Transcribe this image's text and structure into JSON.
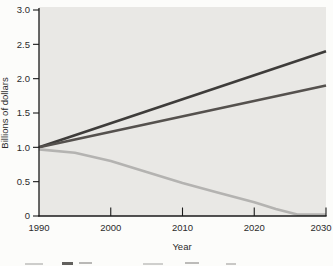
{
  "chart_data": {
    "type": "line",
    "title": "",
    "xlabel": "Year",
    "ylabel": "Billions of dollars",
    "xlim": [
      1990,
      2030
    ],
    "ylim": [
      0,
      3.0
    ],
    "xticks": [
      1990,
      2000,
      2010,
      2020,
      2030
    ],
    "yticks": [
      0,
      0.5,
      1.0,
      1.5,
      2.0,
      2.5,
      3.0
    ],
    "ytick_labels": [
      "0",
      "0.5",
      "1.0",
      "1.5",
      "2.0",
      "2.5",
      "3.0"
    ],
    "grid": false,
    "legend_position": "cropped-below-figure",
    "plot_bg": "#e9e8e5",
    "axis_color": "#1a1a1a",
    "text_color": "#2b2b2b",
    "series": [
      {
        "name": "upper-dark-line",
        "color": "#3e3c3a",
        "x": [
          1990,
          2030
        ],
        "y": [
          1.0,
          2.4
        ]
      },
      {
        "name": "lower-dark-line",
        "color": "#55514e",
        "x": [
          1990,
          2030
        ],
        "y": [
          1.0,
          1.9
        ]
      },
      {
        "name": "light-gray-declining-line",
        "color": "#b4b3b1",
        "x": [
          1990,
          1995,
          2000,
          2005,
          2010,
          2015,
          2020,
          2023,
          2026,
          2030
        ],
        "y": [
          0.97,
          0.92,
          0.8,
          0.64,
          0.48,
          0.34,
          0.2,
          0.1,
          0.02,
          0.02
        ]
      }
    ]
  }
}
